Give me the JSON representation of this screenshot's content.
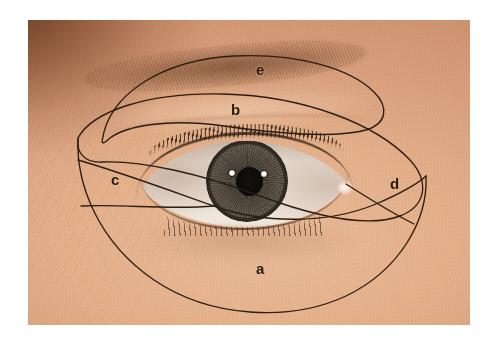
{
  "figure": {
    "background_color": "#ffffff",
    "line_color": "#2b1d12",
    "label_color": "#2a1a0e"
  },
  "photo": {
    "left": 28,
    "top": 20,
    "width": 442,
    "height": 305,
    "skin_tone_light": "#e8b690",
    "skin_tone_mid": "#dda583",
    "skin_tone_shadow": "#7a4a28",
    "eyebrow_color": "#6a4228",
    "iris_color": "#5a5246",
    "pupil_color": "#0b0a08",
    "sclera_color": "#efe6dc",
    "lash_color": "#28190e"
  },
  "labels": [
    {
      "id": "a",
      "text": "a",
      "x": 256,
      "y": 261,
      "region": "lower-outer-zone"
    },
    {
      "id": "b",
      "text": "b",
      "x": 231,
      "y": 102,
      "region": "upper-lid-zone"
    },
    {
      "id": "c",
      "text": "c",
      "x": 111,
      "y": 172,
      "region": "lateral-medial-zone"
    },
    {
      "id": "d",
      "text": "d",
      "x": 390,
      "y": 176,
      "region": "lateral-canthus-zone"
    },
    {
      "id": "e",
      "text": "e",
      "x": 256,
      "y": 62,
      "region": "eyebrow-zone"
    }
  ],
  "outlines": [
    {
      "name": "eyebrow-loop",
      "description": "Narrow elongated loop enclosing the eyebrow, labelled e",
      "d": "M 74,122 C 80,74 134,40 206,36 C 268,33 322,48 346,72 C 362,88 358,104 338,110 C 308,118 252,114 196,106 C 140,98 98,106 82,118 C 78,122 75,124 74,122 Z"
    },
    {
      "name": "upper-lid-loop",
      "description": "Large loop running from the lateral canthus over the upper lid, labelled b",
      "d": "M 50,118 C 64,92 118,72 196,74 C 276,76 348,104 382,140 C 402,162 398,186 372,196 C 340,208 286,196 232,176 C 174,154 112,140 74,142 C 56,143 48,132 50,118 Z"
    },
    {
      "name": "outer-boundary",
      "description": "Large outer contour enclosing the whole periorbital field, labelled a",
      "d": "M 50,118 C 48,164 70,222 126,260 C 182,298 262,302 318,276 C 372,250 400,200 398,156"
    },
    {
      "name": "lateral-divider",
      "description": "Line sweeping from the left border to the lateral canthus region, separating zone c",
      "d": "M 50,140 C 92,152 146,172 186,186 C 236,204 300,204 348,184 C 374,173 392,162 398,156"
    },
    {
      "name": "zone-c-lower-divider",
      "description": "Short line closing the lower boundary of zone c",
      "d": "M 53,186 C 96,184 140,190 186,186"
    },
    {
      "name": "zone-d-divider",
      "description": "Line closing the lower boundary of zone d at the lateral canthus",
      "d": "M 318,164 C 340,178 362,192 386,204"
    }
  ]
}
